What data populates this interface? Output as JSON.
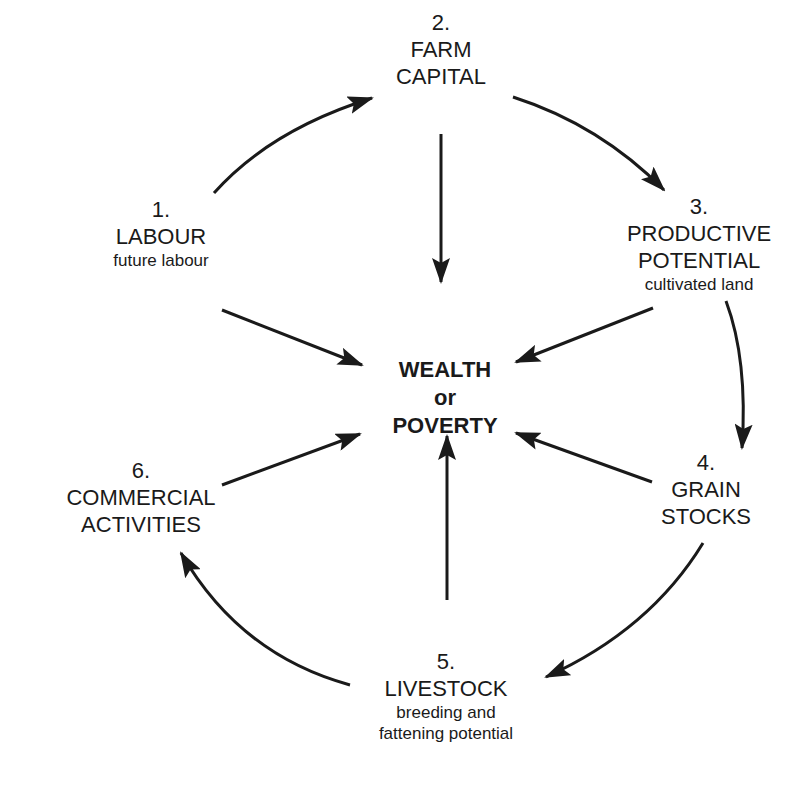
{
  "diagram": {
    "center": {
      "line1": "WEALTH",
      "line2": "or",
      "line3": "POVERTY"
    },
    "nodes": [
      {
        "number": "1.",
        "title": "LABOUR",
        "subtitle": "future labour"
      },
      {
        "number": "2.",
        "title_line1": "FARM",
        "title_line2": "CAPITAL"
      },
      {
        "number": "3.",
        "title_line1": "PRODUCTIVE",
        "title_line2": "POTENTIAL",
        "subtitle": "cultivated land"
      },
      {
        "number": "4.",
        "title_line1": "GRAIN",
        "title_line2": "STOCKS"
      },
      {
        "number": "5.",
        "title": "LIVESTOCK",
        "subtitle_line1": "breeding and",
        "subtitle_line2": "fattening potential"
      },
      {
        "number": "6.",
        "title_line1": "COMMERCIAL",
        "title_line2": "ACTIVITIES"
      }
    ],
    "cycle_edges": [
      "1->2",
      "2->3",
      "3->4",
      "4->5",
      "5->6"
    ],
    "center_edges": [
      "1->center",
      "2->center",
      "3->center",
      "4->center",
      "5->center",
      "6->center"
    ],
    "colors": {
      "line": "#1a1a1a",
      "background": "#ffffff"
    }
  }
}
